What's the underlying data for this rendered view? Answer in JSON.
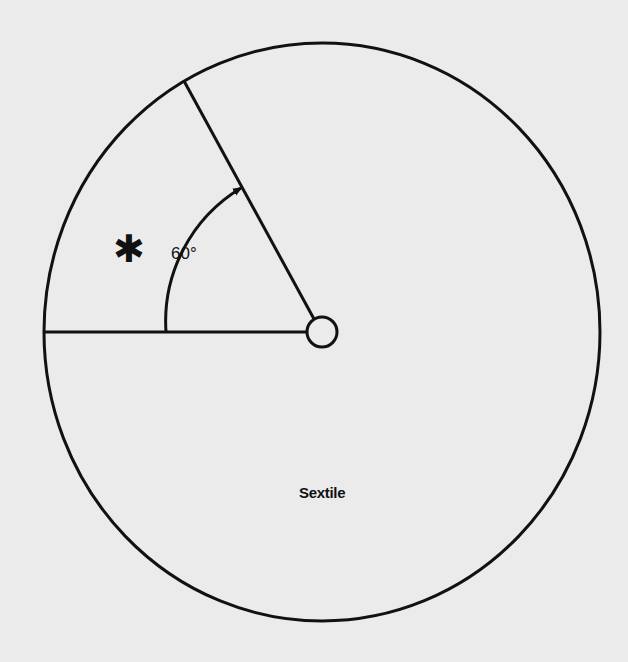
{
  "diagram": {
    "title": "Sextile",
    "angle_label": "60°",
    "star_symbol": "✱",
    "colors": {
      "background": "#ebebeb",
      "ink": "#111111"
    },
    "geometry": {
      "outer_circle": {
        "cx": 322,
        "cy": 332,
        "rx": 278,
        "ry": 289
      },
      "center_circle": {
        "cx": 322,
        "cy": 332,
        "r": 15
      },
      "horizontal_ray": {
        "x1": 44,
        "y1": 332,
        "x2": 307,
        "y2": 332
      },
      "angled_ray": {
        "x1": 184,
        "y1": 81,
        "x2": 314,
        "y2": 319
      },
      "angle_degrees": 60
    }
  }
}
